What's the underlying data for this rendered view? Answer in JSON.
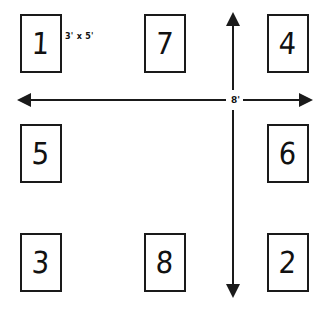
{
  "diagram": {
    "background_color": "#ffffff",
    "stroke_color": "#1a1a1a",
    "boxes": [
      {
        "label": "1",
        "x": 20,
        "y": 14,
        "w": 42,
        "h": 59,
        "row": "top",
        "col": "left"
      },
      {
        "label": "7",
        "x": 144,
        "y": 14,
        "w": 42,
        "h": 59,
        "row": "top",
        "col": "center"
      },
      {
        "label": "4",
        "x": 267,
        "y": 14,
        "w": 42,
        "h": 59,
        "row": "top",
        "col": "right"
      },
      {
        "label": "5",
        "x": 20,
        "y": 124,
        "w": 42,
        "h": 59,
        "row": "middle",
        "col": "left"
      },
      {
        "label": "6",
        "x": 267,
        "y": 124,
        "w": 42,
        "h": 59,
        "row": "middle",
        "col": "right"
      },
      {
        "label": "3",
        "x": 20,
        "y": 233,
        "w": 42,
        "h": 59,
        "row": "bottom",
        "col": "left"
      },
      {
        "label": "8",
        "x": 144,
        "y": 233,
        "w": 42,
        "h": 59,
        "row": "bottom",
        "col": "center"
      },
      {
        "label": "2",
        "x": 267,
        "y": 233,
        "w": 42,
        "h": 59,
        "row": "bottom",
        "col": "right"
      }
    ],
    "dimensions": {
      "box_size": "3' x 5'",
      "horizontal_span": "8'",
      "vertical_span": "8'"
    }
  }
}
